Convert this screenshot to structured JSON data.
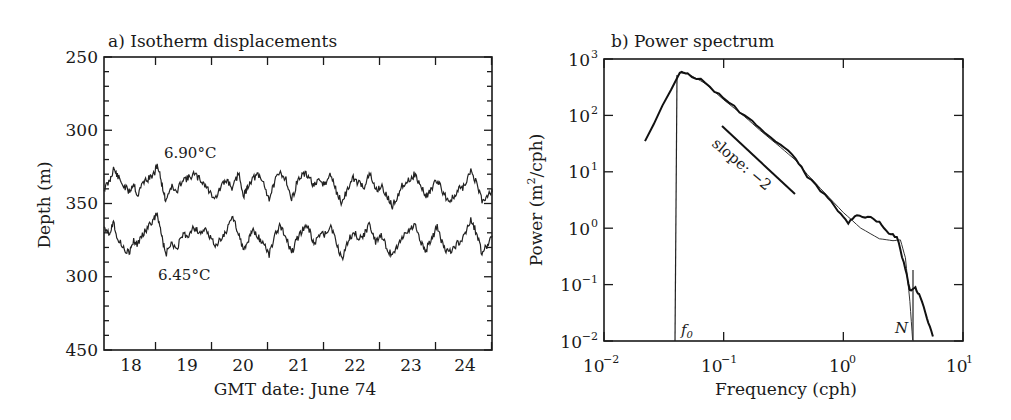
{
  "chart_data": [
    {
      "type": "line",
      "title": "a) Isotherm displacements",
      "xlabel": "GMT date: June 74",
      "ylabel": "Depth (m)",
      "x_tick_labels": [
        "18",
        "19",
        "20",
        "21",
        "22",
        "23",
        "24"
      ],
      "y_tick_labels": [
        "250",
        "300",
        "350",
        "300",
        "450"
      ],
      "ylim": [
        250,
        450
      ],
      "y_inverted": true,
      "xlim_days": [
        17.55,
        24.5
      ],
      "grid": false,
      "series": [
        {
          "name": "6.90°C",
          "x_days": [
            17.55,
            17.65,
            17.72,
            17.8,
            17.9,
            18.0,
            18.08,
            18.15,
            18.25,
            18.35,
            18.45,
            18.5,
            18.58,
            18.65,
            18.75,
            18.85,
            18.95,
            19.05,
            19.15,
            19.25,
            19.35,
            19.45,
            19.55,
            19.65,
            19.75,
            19.85,
            19.95,
            20.05,
            20.12,
            20.2,
            20.3,
            20.4,
            20.5,
            20.6,
            20.7,
            20.8,
            20.9,
            21.0,
            21.1,
            21.2,
            21.3,
            21.4,
            21.5,
            21.6,
            21.7,
            21.8,
            21.9,
            22.0,
            22.1,
            22.2,
            22.3,
            22.4,
            22.5,
            22.6,
            22.7,
            22.8,
            22.9,
            23.0,
            23.1,
            23.2,
            23.3,
            23.4,
            23.5,
            23.6,
            23.7,
            23.8,
            23.9,
            24.0,
            24.1,
            24.2,
            24.3,
            24.4,
            24.5
          ],
          "depth_m": [
            340,
            335,
            326,
            332,
            338,
            342,
            336,
            345,
            335,
            333,
            330,
            323,
            336,
            348,
            338,
            343,
            333,
            333,
            330,
            333,
            337,
            343,
            346,
            338,
            334,
            340,
            329,
            345,
            338,
            333,
            331,
            336,
            347,
            335,
            329,
            333,
            348,
            335,
            330,
            331,
            338,
            335,
            337,
            330,
            342,
            350,
            340,
            333,
            336,
            338,
            330,
            341,
            338,
            345,
            352,
            344,
            336,
            334,
            330,
            338,
            345,
            340,
            334,
            342,
            348,
            346,
            340,
            338,
            327,
            336,
            348,
            344,
            340
          ]
        },
        {
          "name": "6.45°C",
          "x_days": [
            17.55,
            17.65,
            17.72,
            17.8,
            17.9,
            18.0,
            18.08,
            18.15,
            18.25,
            18.35,
            18.45,
            18.5,
            18.58,
            18.65,
            18.75,
            18.85,
            18.95,
            19.05,
            19.15,
            19.25,
            19.35,
            19.45,
            19.55,
            19.65,
            19.75,
            19.85,
            19.95,
            20.05,
            20.12,
            20.2,
            20.3,
            20.4,
            20.5,
            20.6,
            20.7,
            20.8,
            20.9,
            21.0,
            21.1,
            21.2,
            21.3,
            21.4,
            21.5,
            21.6,
            21.7,
            21.8,
            21.9,
            22.0,
            22.1,
            22.2,
            22.3,
            22.4,
            22.5,
            22.6,
            22.7,
            22.8,
            22.9,
            23.0,
            23.1,
            23.2,
            23.3,
            23.4,
            23.5,
            23.6,
            23.7,
            23.8,
            23.9,
            24.0,
            24.1,
            24.2,
            24.3,
            24.4,
            24.5
          ],
          "depth_m": [
            365,
            370,
            362,
            375,
            380,
            384,
            376,
            378,
            370,
            366,
            360,
            356,
            372,
            385,
            378,
            381,
            372,
            372,
            366,
            370,
            368,
            374,
            378,
            374,
            368,
            359,
            370,
            383,
            376,
            368,
            373,
            377,
            385,
            372,
            365,
            372,
            384,
            374,
            368,
            366,
            378,
            372,
            371,
            365,
            378,
            388,
            376,
            370,
            373,
            371,
            364,
            376,
            372,
            380,
            386,
            378,
            372,
            368,
            364,
            376,
            382,
            374,
            366,
            378,
            384,
            380,
            376,
            372,
            361,
            370,
            384,
            378,
            372
          ]
        }
      ],
      "annotations": [
        "6.90°C",
        "6.45°C"
      ]
    },
    {
      "type": "line",
      "title": "b) Power spectrum",
      "xlabel": "Frequency (cph)",
      "ylabel": "Power (m²/cph)",
      "x_scale": "log",
      "y_scale": "log",
      "xlim": [
        0.01,
        10
      ],
      "ylim": [
        0.01,
        1000
      ],
      "x_tick_labels": [
        "10⁻²",
        "10⁻¹",
        "10⁰",
        "10¹"
      ],
      "y_tick_labels": [
        "10⁻²",
        "10⁻¹",
        "10⁰",
        "10¹",
        "10²",
        "10³"
      ],
      "grid": false,
      "series": [
        {
          "name": "observed spectrum",
          "frequency": [
            0.022,
            0.043,
            0.05,
            0.07,
            0.1,
            0.15,
            0.2,
            0.3,
            0.4,
            0.5,
            0.7,
            0.9,
            1.1,
            1.3,
            1.6,
            2.0,
            2.4,
            2.8,
            3.2,
            3.6,
            4.0,
            4.4,
            5.0,
            5.6
          ],
          "power": [
            35,
            570,
            560,
            380,
            200,
            100,
            60,
            30,
            17,
            8,
            4,
            2.0,
            1.2,
            1.7,
            1.6,
            1.3,
            0.8,
            0.7,
            0.25,
            0.08,
            0.09,
            0.06,
            0.025,
            0.012
          ]
        },
        {
          "name": "model spectrum",
          "frequency": [
            0.043,
            0.05,
            0.07,
            0.1,
            0.15,
            0.2,
            0.3,
            0.4,
            0.5,
            0.7,
            1.0,
            1.4,
            2.0,
            2.6,
            3.0,
            3.3,
            3.6,
            3.8
          ],
          "power": [
            570,
            550,
            370,
            190,
            95,
            55,
            27,
            16,
            9,
            4.2,
            1.9,
            1.0,
            0.65,
            0.6,
            0.62,
            0.3,
            0.05,
            0.01
          ]
        }
      ],
      "reference_lines": [
        {
          "label": "slope: −2",
          "from_frequency": 0.1,
          "from_power": 60,
          "to_frequency": 0.4,
          "to_power": 3.7
        },
        {
          "label": "f₀",
          "frequency": 0.043
        },
        {
          "label": "N",
          "frequency": 3.75
        }
      ]
    }
  ],
  "panel_a": {
    "title": "a) Isotherm displacements",
    "ylabel": "Depth (m)",
    "xlabel": "GMT date: June 74",
    "y_ticks": [
      "250",
      "300",
      "350",
      "300",
      "450"
    ],
    "x_ticks": [
      "18",
      "19",
      "20",
      "21",
      "22",
      "23",
      "24"
    ],
    "label_upper": "6.90°C",
    "label_lower": "6.45°C"
  },
  "panel_b": {
    "title": "b) Power spectrum",
    "ylabel_main": "Power (m",
    "ylabel_sup": "2",
    "ylabel_tail": "/cph)",
    "xlabel": "Frequency (cph)",
    "y_ticks": [
      {
        "base": "10",
        "exp": "3"
      },
      {
        "base": "10",
        "exp": "2"
      },
      {
        "base": "10",
        "exp": "1"
      },
      {
        "base": "10",
        "exp": "0"
      },
      {
        "base": "10",
        "exp": "−1"
      },
      {
        "base": "10",
        "exp": "−2"
      }
    ],
    "x_ticks": [
      {
        "base": "10",
        "exp": "−2"
      },
      {
        "base": "10",
        "exp": "−1"
      },
      {
        "base": "10",
        "exp": "0"
      },
      {
        "base": "10",
        "exp": "1"
      }
    ],
    "slope_label": "slope: −2",
    "f0_label": "f",
    "f0_sub": "0",
    "n_label": "N"
  }
}
